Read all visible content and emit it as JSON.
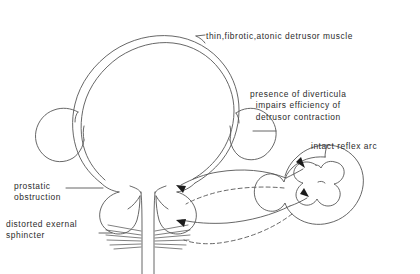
{
  "figure": {
    "background_color": "#ffffff",
    "line_color": "#4a4a4a",
    "text_color": "#2b2b2b"
  },
  "labels": {
    "detrusor": "thin,fibrotic,atonic detrusor muscle",
    "diverticula_line1": "presence of diverticula",
    "diverticula_line2": "impairs efficiency of",
    "diverticula_line3": "detrusor contraction",
    "reflex_arc": "intact reflex arc",
    "prostatic_line1": "prostatic",
    "prostatic_line2": "obstruction",
    "sphincter_line1": "distorted  exernal",
    "sphincter_line2": "sphincter"
  },
  "anatomy": {
    "bladder": "bladder-dome-double-walled",
    "diverticulum_left": "left-bladder-diverticulum",
    "diverticulum_right": "right-bladder-diverticulum",
    "prostate": "prostate-gland",
    "urethra": "urethra",
    "external_sphincter": "striated-external-sphincter",
    "spinal_cord": "spinal-cord-cross-section",
    "gray_matter": "gray-matter-butterfly"
  },
  "arrows": {
    "afferent_solid_upper": "solid-arrow-to-bladder-neck",
    "afferent_solid_lower": "solid-arrow-to-sphincter",
    "efferent_dashed_upper": "dashed-arc-from-cord-upper",
    "efferent_dashed_lower": "dashed-arc-from-cord-lower"
  }
}
